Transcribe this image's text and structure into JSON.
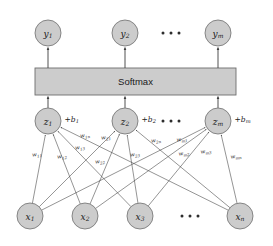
{
  "diagram": {
    "background_color": "#ffffff",
    "node_fill": "#cccccc",
    "node_stroke": "#7a7a7a",
    "edge_color": "#3c3c3c"
  },
  "softmax": {
    "label": "Softmax",
    "fill": "#cccccc",
    "stroke": "#6e6e6e"
  },
  "output_layer": {
    "name": "output-layer",
    "nodes": [
      {
        "base": "y",
        "sub": "1",
        "cx": 48,
        "cy": 33
      },
      {
        "base": "y",
        "sub": "2",
        "cx": 125,
        "cy": 33
      },
      {
        "base": "y",
        "sub": "m",
        "cx": 218,
        "cy": 33
      }
    ],
    "ellipsis": {
      "cx": 171,
      "cy": 33,
      "count": 3
    }
  },
  "logit_layer": {
    "name": "logit-layer",
    "nodes": [
      {
        "base": "z",
        "sub": "1",
        "cx": 48,
        "cy": 121,
        "bias_base": "b",
        "bias_sub": "1",
        "bias_text": "+b"
      },
      {
        "base": "z",
        "sub": "2",
        "cx": 125,
        "cy": 121,
        "bias_base": "b",
        "bias_sub": "2",
        "bias_text": "+b"
      },
      {
        "base": "z",
        "sub": "m",
        "cx": 218,
        "cy": 121,
        "bias_base": "b",
        "bias_sub": "m",
        "bias_text": "+b"
      }
    ],
    "ellipsis": {
      "cx": 171,
      "cy": 121,
      "count": 3
    }
  },
  "input_layer": {
    "name": "input-layer",
    "nodes": [
      {
        "base": "x",
        "sub": "1",
        "cx": 30,
        "cy": 216
      },
      {
        "base": "x",
        "sub": "2",
        "cx": 85,
        "cy": 216
      },
      {
        "base": "x",
        "sub": "3",
        "cx": 140,
        "cy": 216
      },
      {
        "base": "x",
        "sub": "n",
        "cx": 240,
        "cy": 216
      }
    ],
    "ellipsis": {
      "cx": 190,
      "cy": 216,
      "count": 3
    }
  },
  "weights": [
    {
      "base": "w",
      "sub": "11",
      "x": 37,
      "y": 155,
      "rot": -8
    },
    {
      "base": "w",
      "sub": "12",
      "x": 62,
      "y": 157,
      "rot": -8
    },
    {
      "base": "w",
      "sub": "13",
      "x": 80,
      "y": 148,
      "rot": -8
    },
    {
      "base": "w",
      "sub": "1n",
      "x": 85,
      "y": 136,
      "rot": -8
    },
    {
      "base": "w",
      "sub": "21",
      "x": 106,
      "y": 138,
      "rot": -8
    },
    {
      "base": "w",
      "sub": "22",
      "x": 100,
      "y": 162,
      "rot": -8
    },
    {
      "base": "w",
      "sub": "23",
      "x": 135,
      "y": 155,
      "rot": -8
    },
    {
      "base": "w",
      "sub": "2n",
      "x": 156,
      "y": 141,
      "rot": -8
    },
    {
      "base": "w",
      "sub": "m1",
      "x": 182,
      "y": 140,
      "rot": -8
    },
    {
      "base": "w",
      "sub": "m2",
      "x": 184,
      "y": 154,
      "rot": -8
    },
    {
      "base": "w",
      "sub": "m3",
      "x": 206,
      "y": 152,
      "rot": -8
    },
    {
      "base": "w",
      "sub": "mn",
      "x": 236,
      "y": 157,
      "rot": -8
    }
  ],
  "connections": [
    {
      "from": 0,
      "to": 0
    },
    {
      "from": 1,
      "to": 0
    },
    {
      "from": 2,
      "to": 0
    },
    {
      "from": 3,
      "to": 0
    },
    {
      "from": 0,
      "to": 1
    },
    {
      "from": 1,
      "to": 1
    },
    {
      "from": 2,
      "to": 1
    },
    {
      "from": 3,
      "to": 1
    },
    {
      "from": 0,
      "to": 2
    },
    {
      "from": 1,
      "to": 2
    },
    {
      "from": 2,
      "to": 2
    },
    {
      "from": 3,
      "to": 2
    }
  ],
  "geometry": {
    "node_radius_output": 13,
    "node_radius_logit": 13,
    "node_radius_input": 13,
    "softmax_box": {
      "x": 35,
      "y": 68,
      "w": 201,
      "h": 27
    }
  }
}
